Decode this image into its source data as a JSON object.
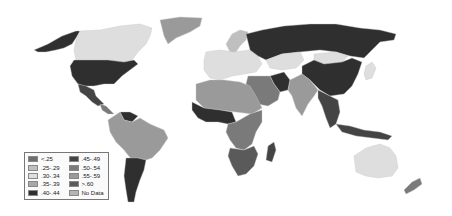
{
  "map": {
    "type": "choropleth",
    "subject": "World map shaded by index ranges",
    "colors": {
      "lt_25": "#6f6f6f",
      "r25_29": "#bfbfbf",
      "r30_34": "#dedede",
      "r35_39": "#a8a8a8",
      "r40_44": "#2f2f2f",
      "r45_49": "#444444",
      "r50_54": "#7a7a7a",
      "r55_59": "#9a9a9a",
      "gt_60": "#5a5a5a",
      "no_data": "#b4b4b4"
    },
    "regions": {
      "usa": "r40_44",
      "canada": "r30_34",
      "alaska": "r40_44",
      "greenland": "r55_59",
      "mexico": "r45_49",
      "central_america": "r50_54",
      "south_america_north": "r55_59",
      "venezuela": "r40_44",
      "argentina": "r40_44",
      "europe": "r30_34",
      "scandinavia": "r25_29",
      "russia": "r40_44",
      "kazakhstan": "r30_34",
      "mongolia": "r30_34",
      "china": "r40_44",
      "middle_east": "r50_54",
      "iran": "r40_44",
      "india": "r55_59",
      "southeast_asia": "r45_49",
      "japan": "r30_34",
      "north_africa": "r55_59",
      "west_africa": "r40_44",
      "central_africa": "r50_54",
      "southern_africa": "gt_60",
      "madagascar": "r45_49",
      "australia": "r30_34",
      "new_zealand": "r50_54"
    }
  },
  "legend": {
    "items": [
      {
        "label": "<.25",
        "color": "#6f6f6f"
      },
      {
        "label": ".25-.29",
        "color": "#bfbfbf"
      },
      {
        "label": ".30-.34",
        "color": "#dedede"
      },
      {
        "label": ".35-.39",
        "color": "#a8a8a8"
      },
      {
        "label": ".40-.44",
        "color": "#2f2f2f"
      },
      {
        "label": ".45-.49",
        "color": "#444444"
      },
      {
        "label": ".50-.54",
        "color": "#7a7a7a"
      },
      {
        "label": ".55-.59",
        "color": "#9a9a9a"
      },
      {
        "label": ">.60",
        "color": "#5a5a5a"
      },
      {
        "label": "No Data",
        "color": "#b4b4b4"
      }
    ]
  }
}
